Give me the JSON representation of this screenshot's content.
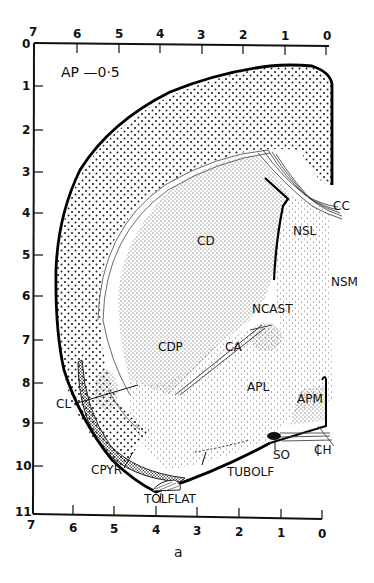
{
  "figure": {
    "title": "AP —0·5",
    "caption": "a",
    "axes": {
      "top": {
        "ticks": [
          "7",
          "6",
          "5",
          "4",
          "3",
          "2",
          "1",
          "0"
        ]
      },
      "bottom": {
        "ticks": [
          "7",
          "6",
          "5",
          "4",
          "3",
          "2",
          "1",
          "0"
        ]
      },
      "left": {
        "ticks": [
          "0",
          "1",
          "2",
          "3",
          "4",
          "5",
          "6",
          "7",
          "8",
          "9",
          "10",
          "11"
        ]
      }
    },
    "regions": {
      "cc": "CC",
      "cd": "CD",
      "nsl": "NSL",
      "nsm": "NSM",
      "ncast": "NCAST",
      "cdp": "CDP",
      "ca": "CA",
      "apl": "APL",
      "apm": "APM",
      "cl": "CL",
      "so": "SO",
      "ch": "CH",
      "cpyr": "CPYR",
      "tubolf": "TUBOLF",
      "tolflat": "TOLFLAT"
    }
  }
}
